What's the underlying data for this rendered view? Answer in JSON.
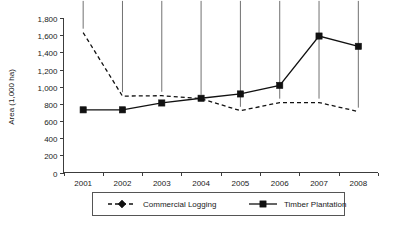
{
  "chart_data": {
    "type": "line",
    "title": "",
    "xlabel": "",
    "ylabel": "Area (1,000 ha)",
    "categories": [
      "2001",
      "2002",
      "2003",
      "2004",
      "2005",
      "2006",
      "2007",
      "2008"
    ],
    "series": [
      {
        "name": "Commercial Logging",
        "marker": "diamond",
        "line_style": "dashed",
        "color": "#111111",
        "values": [
          1630,
          890,
          895,
          860,
          720,
          815,
          815,
          710
        ]
      },
      {
        "name": "Timber Plantation",
        "marker": "square",
        "line_style": "solid",
        "color": "#111111",
        "values": [
          730,
          730,
          810,
          865,
          915,
          1015,
          1590,
          1470
        ]
      }
    ],
    "ylim": [
      0,
      1800
    ],
    "ytick_values": [
      0,
      200,
      400,
      600,
      800,
      1000,
      1200,
      1400,
      1600,
      1800
    ],
    "ytick_labels": [
      "0",
      "200",
      "400",
      "600",
      "800",
      "1,000",
      "1,200",
      "1,400",
      "1,600",
      "1,800"
    ],
    "grid": false,
    "legend_position": "bottom"
  },
  "legend": {
    "entries": [
      {
        "label": "Commercial Logging",
        "marker": "diamond-marker-icon",
        "style": "dashed"
      },
      {
        "label": "Timber Plantation",
        "marker": "square-marker-icon",
        "style": "solid"
      }
    ]
  }
}
